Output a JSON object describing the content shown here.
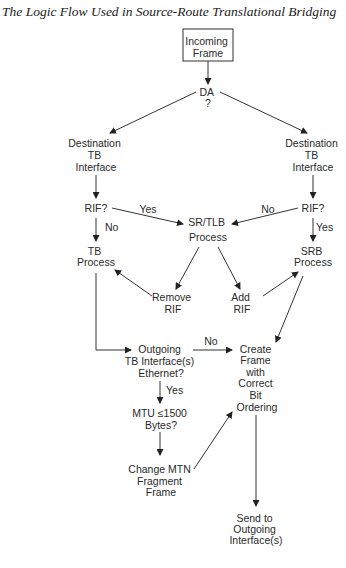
{
  "title": "The Logic Flow Used in Source-Route Translational Bridging",
  "nodes": {
    "incoming": [
      "Incoming",
      "Frame"
    ],
    "da": [
      "DA",
      "?"
    ],
    "dest_left": [
      "Destination",
      "TB",
      "Interface"
    ],
    "dest_right": [
      "Destination",
      "TB",
      "Interface"
    ],
    "rif_left": [
      "RIF?"
    ],
    "rif_right": [
      "RIF?"
    ],
    "srtlb": [
      "SR/TLB",
      "Process"
    ],
    "tb_process": [
      "TB",
      "Process"
    ],
    "srb_process": [
      "SRB",
      "Process"
    ],
    "remove_rif": [
      "Remove",
      "RIF"
    ],
    "add_rif": [
      "Add",
      "RIF"
    ],
    "outgoing": [
      "Outgoing",
      "TB Interface(s)",
      "Ethernet?"
    ],
    "create_frame": [
      "Create",
      "Frame",
      "with",
      "Correct",
      "Bit",
      "Ordering"
    ],
    "mtu": [
      "MTU ≤1500",
      "Bytes?"
    ],
    "change_mtn": [
      "Change MTN",
      "Fragment",
      "Frame"
    ],
    "send": [
      "Send to",
      "Outgoing",
      "Interface(s)"
    ]
  },
  "edge_labels": {
    "rif_left_yes": "Yes",
    "rif_left_no": "No",
    "rif_right_no": "No",
    "rif_right_yes": "Yes",
    "outgoing_no": "No",
    "outgoing_yes": "Yes"
  }
}
